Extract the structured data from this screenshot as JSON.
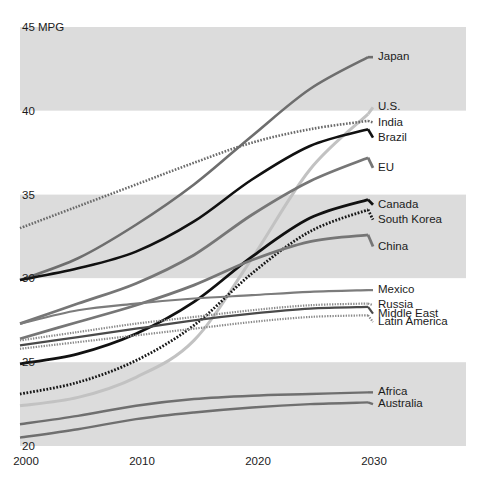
{
  "chart_data": {
    "type": "line",
    "title": "",
    "subtitle": "",
    "xlabel": "",
    "ylabel": "45 MPG",
    "y_axis_unit": "MPG",
    "xlim": [
      2000,
      2030
    ],
    "ylim": [
      20,
      45
    ],
    "x": [
      2000,
      2005,
      2010,
      2015,
      2020,
      2025,
      2030
    ],
    "xticks": [
      "2000",
      "2010",
      "2020",
      "2030"
    ],
    "xtick_values": [
      2000,
      2010,
      2020,
      2030
    ],
    "yticks": [
      "45 MPG",
      "40",
      "35",
      "30",
      "25",
      "20"
    ],
    "ytick_values": [
      45,
      40,
      35,
      30,
      25,
      20
    ],
    "grid": false,
    "banding": "alternating horizontal bands every 5 MPG",
    "legend_position": "right-end-of-line labels",
    "series": [
      {
        "name": "Japan",
        "label": "Japan",
        "color": "#6e6e6e",
        "style": "solid",
        "width": 2.6,
        "values": [
          29.9,
          31.2,
          33.2,
          35.6,
          38.5,
          41.3,
          43.2
        ]
      },
      {
        "name": "U.S.",
        "label": "U.S.",
        "color": "#c2c2c2",
        "style": "solid",
        "width": 3.0,
        "values": [
          22.4,
          22.9,
          24.1,
          26.3,
          31.2,
          36.5,
          39.8
        ]
      },
      {
        "name": "India",
        "label": "India",
        "color": "#6a6a6a",
        "style": "dotted",
        "width": 2.6,
        "values": [
          33.0,
          34.3,
          35.6,
          36.9,
          38.1,
          38.9,
          39.4
        ]
      },
      {
        "name": "Brazil",
        "label": "Brazil",
        "color": "#111111",
        "style": "solid",
        "width": 2.6,
        "values": [
          29.9,
          30.6,
          31.6,
          33.4,
          35.9,
          37.9,
          38.9
        ]
      },
      {
        "name": "EU",
        "label": "EU",
        "color": "#767676",
        "style": "solid",
        "width": 2.8,
        "values": [
          27.3,
          28.5,
          29.7,
          31.4,
          33.8,
          35.8,
          37.2
        ]
      },
      {
        "name": "Canada",
        "label": "Canada",
        "color": "#111111",
        "style": "solid",
        "width": 2.8,
        "values": [
          24.9,
          25.5,
          26.7,
          28.6,
          31.3,
          33.6,
          34.7
        ]
      },
      {
        "name": "South Korea",
        "label": "South Korea",
        "color": "#171717",
        "style": "dotted",
        "width": 2.8,
        "values": [
          23.1,
          23.8,
          25.1,
          27.2,
          30.3,
          32.8,
          34.1
        ]
      },
      {
        "name": "China",
        "label": "China",
        "color": "#767676",
        "style": "solid",
        "width": 2.8,
        "values": [
          26.4,
          27.4,
          28.4,
          29.6,
          31.1,
          32.2,
          32.6
        ]
      },
      {
        "name": "Mexico",
        "label": "Mexico",
        "color": "#7c7c7c",
        "style": "solid",
        "width": 2.2,
        "values": [
          27.3,
          28.1,
          28.5,
          28.8,
          29.0,
          29.2,
          29.3
        ]
      },
      {
        "name": "Russia",
        "label": "Russia",
        "color": "#8a8a8a",
        "style": "dotted",
        "width": 2.2,
        "values": [
          26.3,
          26.8,
          27.3,
          27.7,
          28.1,
          28.4,
          28.5
        ]
      },
      {
        "name": "Middle East",
        "label": "Middle East",
        "color": "#4a4a4a",
        "style": "solid",
        "width": 2.2,
        "values": [
          26.0,
          26.5,
          27.0,
          27.5,
          27.9,
          28.2,
          28.3
        ]
      },
      {
        "name": "Latin America",
        "label": "Latin America",
        "color": "#8a8a8a",
        "style": "dotted",
        "width": 2.2,
        "values": [
          25.8,
          26.2,
          26.6,
          27.0,
          27.4,
          27.7,
          27.8
        ]
      },
      {
        "name": "Africa",
        "label": "Africa",
        "color": "#6f6f6f",
        "style": "solid",
        "width": 2.4,
        "values": [
          21.3,
          21.8,
          22.4,
          22.8,
          23.0,
          23.1,
          23.2
        ]
      },
      {
        "name": "Australia",
        "label": "Australia",
        "color": "#6f6f6f",
        "style": "solid",
        "width": 2.4,
        "values": [
          20.5,
          21.0,
          21.6,
          22.0,
          22.3,
          22.5,
          22.6
        ]
      }
    ],
    "label_positions": [
      {
        "name": "Japan",
        "y_value": 43.2
      },
      {
        "name": "U.S.",
        "y_value": 40.2
      },
      {
        "name": "India",
        "y_value": 39.3
      },
      {
        "name": "Brazil",
        "y_value": 38.4
      },
      {
        "name": "EU",
        "y_value": 36.6
      },
      {
        "name": "Canada",
        "y_value": 34.4
      },
      {
        "name": "South Korea",
        "y_value": 33.5
      },
      {
        "name": "China",
        "y_value": 31.9
      },
      {
        "name": "Mexico",
        "y_value": 29.3
      },
      {
        "name": "Russia",
        "y_value": 28.4
      },
      {
        "name": "Middle East",
        "y_value": 27.9
      },
      {
        "name": "Latin America",
        "y_value": 27.4
      },
      {
        "name": "Africa",
        "y_value": 23.2
      },
      {
        "name": "Australia",
        "y_value": 22.5
      }
    ]
  },
  "colors": {
    "band_gray": "#dcdcdc",
    "band_white": "#ffffff",
    "page_background": "#ffffff",
    "text": "#1b1b1b"
  }
}
